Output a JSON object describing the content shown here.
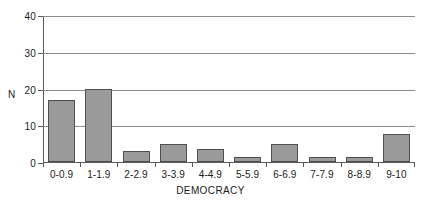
{
  "chart_data": {
    "type": "bar",
    "title": "",
    "subtitle": "",
    "xlabel": "DEMOCRACY",
    "ylabel": "N",
    "categories": [
      "0-0.9",
      "1-1.9",
      "2-2.9",
      "3-3.9",
      "4-4.9",
      "5-5.9",
      "6-6.9",
      "7-7.9",
      "8-8.9",
      "9-10"
    ],
    "values": [
      17,
      20,
      3,
      5,
      3.5,
      1.5,
      5,
      1.5,
      1.3,
      7.5
    ],
    "ylim": [
      0,
      40
    ],
    "yticks": [
      0,
      10,
      20,
      30,
      40
    ],
    "ytick_labels": [
      "0",
      "10",
      "20",
      "30",
      "40"
    ],
    "grid": "horizontal",
    "legend": "none",
    "annotations": [],
    "colors": {
      "bar_fill": "#9a9a9a",
      "bar_edge": "#4f4f4f",
      "gridline": "#8d8d8d",
      "axis": "#5a5a5a",
      "text": "#1a1a1a",
      "background": "#ffffff"
    }
  }
}
